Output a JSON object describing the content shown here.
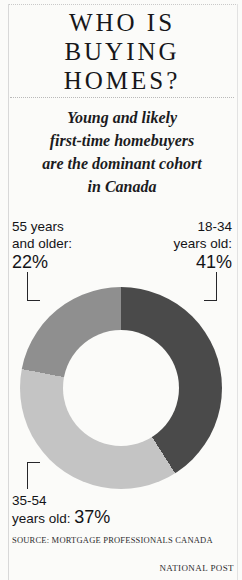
{
  "title": {
    "lines": [
      "WHO IS",
      "BUYING",
      "HOMES?"
    ]
  },
  "subtitle": {
    "lines": [
      "Young and likely",
      "first-time homebuyers",
      "are the dominant cohort",
      "in Canada"
    ]
  },
  "labels": {
    "older": {
      "line1": "55 years",
      "line2": "and older:",
      "percent": "22%"
    },
    "young": {
      "line1": "18-34",
      "line2": "years old:",
      "percent": "41%"
    },
    "middle": {
      "line1": "35-54",
      "line2": "years old: ",
      "percent": "37%"
    }
  },
  "footer": {
    "source": "SOURCE: MORTGAGE PROFESSIONALS CANADA",
    "credit": "NATIONAL POST"
  },
  "chart_data": {
    "type": "pie",
    "variant": "donut",
    "title": "WHO IS BUYING HOMES?",
    "subtitle": "Young and likely first-time homebuyers are the dominant cohort in Canada",
    "categories": [
      "18-34 years old",
      "35-54 years old",
      "55 years and older"
    ],
    "values": [
      41,
      37,
      22
    ],
    "value_labels": [
      "41%",
      "37%",
      "22%"
    ],
    "unit": "percent",
    "colors": [
      "#4a4a4a",
      "#c4c4c4",
      "#8f8f8f"
    ],
    "start_angle_deg": 0,
    "direction": "clockwise",
    "inner_radius_ratio": 0.575,
    "legend": "callout-labels",
    "grid": false,
    "total": 100
  }
}
